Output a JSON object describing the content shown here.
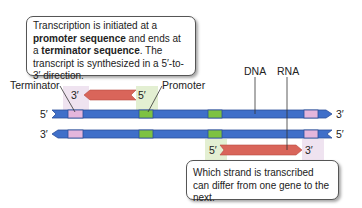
{
  "callout_top": {
    "parts": [
      {
        "text": "Transcription is initiated at a ",
        "bold": false
      },
      {
        "text": "promoter sequence",
        "bold": true
      },
      {
        "text": " and ends at a ",
        "bold": false
      },
      {
        "text": "terminator sequence",
        "bold": true
      },
      {
        "text": ". The transcript is synthesized in a 5′-to-3′ direction.",
        "bold": false
      }
    ]
  },
  "callout_bottom": {
    "text": "Which strand is transcribed can differ from one gene to the next."
  },
  "labels": {
    "terminator": "Terminator",
    "promoter": "Promoter",
    "dna": "DNA",
    "rna": "RNA",
    "top_strand_left": "5′",
    "top_strand_right": "3′",
    "bottom_strand_left": "3′",
    "bottom_strand_right": "5′",
    "rna_top_left": "3′",
    "rna_top_right": "5′",
    "rna_bottom_left": "5′",
    "rna_bottom_right": "3′"
  },
  "colors": {
    "dna_blue": "#3f6fc9",
    "dna_dark": "#2c4f9a",
    "promoter_green": "#7dc242",
    "terminator_pink": "#e4b6dc",
    "rna_red": "#d9655a",
    "shade_green": "#e3efd2",
    "shade_pink": "#efe3f0"
  }
}
